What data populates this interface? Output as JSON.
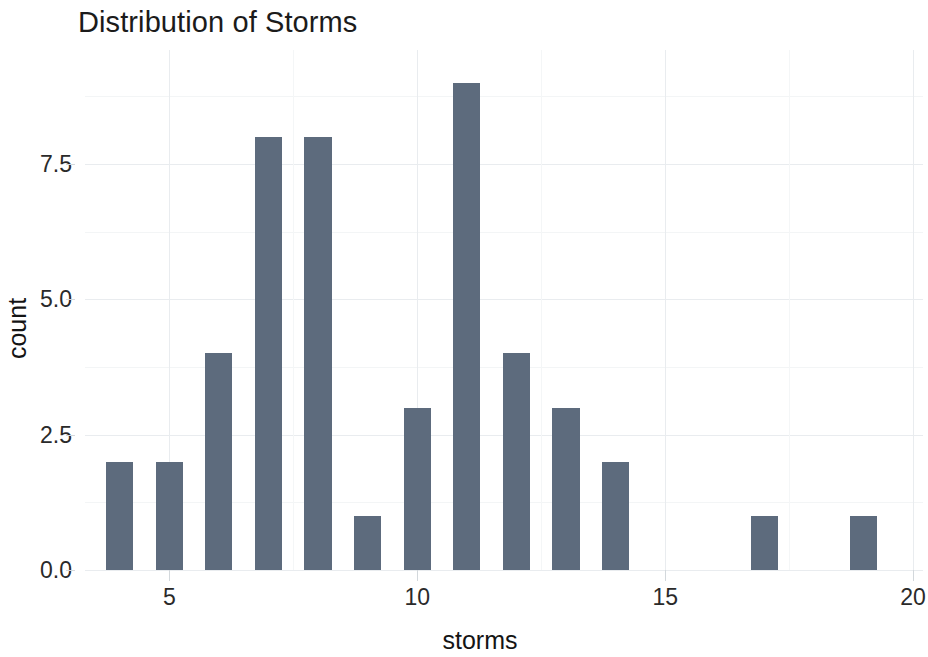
{
  "chart_data": {
    "type": "bar",
    "title": "Distribution of Storms",
    "xlabel": "storms",
    "ylabel": "count",
    "categories": [
      4,
      5,
      6,
      7,
      8,
      9,
      10,
      11,
      12,
      13,
      14,
      17,
      19
    ],
    "values": [
      2,
      2,
      4,
      8,
      8,
      1,
      3,
      9,
      4,
      3,
      2,
      1,
      1
    ],
    "x": [
      4,
      5,
      6,
      7,
      8,
      9,
      10,
      11,
      12,
      13,
      14,
      17,
      19
    ],
    "series": [
      {
        "name": "count",
        "values": [
          2,
          2,
          4,
          8,
          8,
          1,
          3,
          9,
          4,
          3,
          2,
          1,
          1
        ]
      }
    ],
    "xlim": [
      3.3,
      20.2
    ],
    "ylim": [
      0,
      9.6
    ],
    "xticks": [
      5,
      10,
      15,
      20
    ],
    "xtick_labels": [
      "5",
      "10",
      "15",
      "20"
    ],
    "yticks": [
      0.0,
      2.5,
      5.0,
      7.5
    ],
    "ytick_labels": [
      "0.0",
      "2.5",
      "5.0",
      "7.5"
    ],
    "y_minor_ticks": [
      1.25,
      3.75,
      6.25,
      8.75
    ],
    "x_minor_ticks": [
      7.5,
      12.5,
      17.5
    ],
    "grid": true,
    "legend": false,
    "bar_color": "#5d6b7d",
    "grid_color": "#e9ecef",
    "background_color": "#ffffff",
    "bar_width_fraction": 0.55
  }
}
